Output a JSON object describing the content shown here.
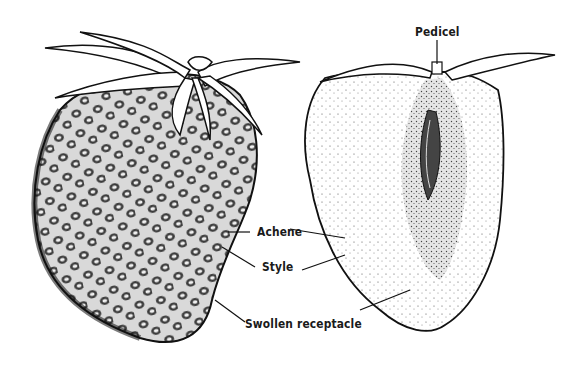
{
  "diagram": {
    "figures": [
      {
        "id": "whole-fruit",
        "description": "Exterior view of strawberry with sepals and achenes"
      },
      {
        "id": "longitudinal-section",
        "description": "Cut section of strawberry showing pedicel and receptacle"
      }
    ],
    "labels": {
      "pedicel": "Pedicel",
      "achene": "Achene",
      "style": "Style",
      "swollen_receptacle": "Swollen receptacle"
    }
  }
}
